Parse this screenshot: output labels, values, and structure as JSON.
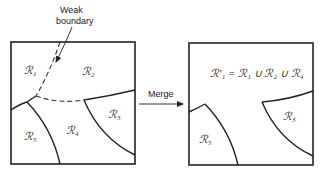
{
  "annotation": {
    "weak_boundary_line1": "Weak",
    "weak_boundary_line2": "boundary"
  },
  "merge_label": "Merge",
  "before": {
    "regions": [
      {
        "id": "R1",
        "glyph": "ℛ",
        "sub": "1"
      },
      {
        "id": "R2",
        "glyph": "ℛ",
        "sub": "2"
      },
      {
        "id": "R3",
        "glyph": "ℛ",
        "sub": "3"
      },
      {
        "id": "R4",
        "glyph": "ℛ",
        "sub": "4"
      },
      {
        "id": "R5",
        "glyph": "ℛ",
        "sub": "5"
      }
    ]
  },
  "after": {
    "merged_label": "ℛ′₁ = ℛ₁ ∪ ℛ₂ ∪ ℛ₄",
    "regions": [
      {
        "id": "R3",
        "glyph": "ℛ",
        "sub": "3"
      },
      {
        "id": "R5",
        "glyph": "ℛ",
        "sub": "5"
      }
    ]
  }
}
